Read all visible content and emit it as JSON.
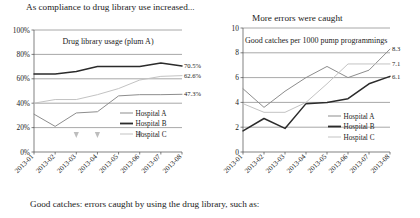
{
  "figure": {
    "left_heading": "As compliance to drug library use increased...",
    "right_heading": "More errors were caught",
    "caption": "Good catches: errors caught by using the drug library, such as:"
  },
  "colors": {
    "hospital_a": "#8d8d8d",
    "hospital_b": "#2b2b2b",
    "hospital_c": "#c3c3c3",
    "grid": "#5f5f5f",
    "axis": "#4a4a4a",
    "marker": "#bdbdbd",
    "text": "#1b1b1b"
  },
  "legend": {
    "items": [
      {
        "label": "Hospital A",
        "color": "#8d8d8d"
      },
      {
        "label": "Hospital B",
        "color": "#2b2b2b"
      },
      {
        "label": "Hospital C",
        "color": "#c3c3c3"
      }
    ]
  },
  "chart_data": [
    {
      "id": "left",
      "type": "line",
      "title": "Drug library usage (plum A)",
      "xlabel": "",
      "ylabel": "",
      "categories": [
        "2013-01",
        "2013-02",
        "2013-03",
        "2013-04",
        "2013-05",
        "2013-06",
        "2013-07",
        "2013-08"
      ],
      "ylim": [
        0,
        100
      ],
      "yticks": [
        0,
        20,
        40,
        60,
        80,
        100
      ],
      "ytick_labels": [
        "0%",
        "20%",
        "40%",
        "60%",
        "80%",
        "100%"
      ],
      "grid": true,
      "legend_position": "inside-right",
      "series": [
        {
          "name": "Hospital A",
          "color": "#8d8d8d",
          "values": [
            31,
            21,
            32,
            33,
            46,
            47,
            47,
            47.3
          ],
          "end_label": "47.3%"
        },
        {
          "name": "Hospital B",
          "color": "#2b2b2b",
          "values": [
            64,
            64,
            66,
            70,
            70,
            70,
            73,
            70.5
          ],
          "end_label": "70.5%"
        },
        {
          "name": "Hospital C",
          "color": "#c3c3c3",
          "values": [
            40,
            43,
            43,
            47,
            52,
            59,
            62,
            62.6
          ],
          "end_label": "62.6%"
        }
      ],
      "markers": {
        "symbol": "down-triangle",
        "color": "#bdbdbd",
        "at": [
          "2013-03",
          "2013-04",
          "2013-06"
        ]
      }
    },
    {
      "id": "right",
      "type": "line",
      "title": "Good catches per 1000 pump programmings",
      "xlabel": "",
      "ylabel": "",
      "categories": [
        "2013-01",
        "2013-02",
        "2013-03",
        "2013-04",
        "2013-05",
        "2013-06",
        "2013-07",
        "2013-08"
      ],
      "ylim": [
        0,
        10
      ],
      "yticks": [
        0,
        2,
        4,
        6,
        8,
        10
      ],
      "ytick_labels": [
        "0",
        "2",
        "4",
        "6",
        "8",
        "10"
      ],
      "grid": true,
      "legend_position": "inside-right",
      "series": [
        {
          "name": "Hospital A",
          "color": "#8d8d8d",
          "values": [
            5.1,
            3.6,
            4.9,
            6.0,
            6.9,
            6.0,
            6.6,
            8.3
          ],
          "end_label": "8.3"
        },
        {
          "name": "Hospital B",
          "color": "#2b2b2b",
          "values": [
            1.7,
            2.7,
            1.9,
            3.9,
            4.0,
            4.3,
            5.5,
            6.1
          ],
          "end_label": "6.1"
        },
        {
          "name": "Hospital C",
          "color": "#c3c3c3",
          "values": [
            3.9,
            3.2,
            3.2,
            4.0,
            5.5,
            7.1,
            7.1,
            7.1
          ],
          "end_label": "7.1"
        }
      ]
    }
  ]
}
